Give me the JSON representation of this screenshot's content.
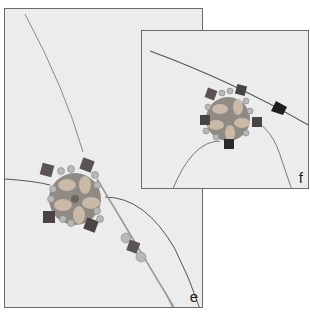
{
  "figure": {
    "panels": [
      {
        "id": "e",
        "label": "e",
        "description": "Beaded star component with wire strands; seed beads and cube beads strung on a needle"
      },
      {
        "id": "f",
        "label": "f",
        "description": "Beaded star component with crystal bicone strung on the wire"
      }
    ],
    "colors": {
      "background": "#ececec",
      "border": "#6b6b6b",
      "wire": "#7a7a7a",
      "bead_light": "#c9b9a6",
      "bead_seed": "#b8b8b8",
      "bead_cube": "#5a5454",
      "crystal": "#1e1e1e"
    }
  }
}
